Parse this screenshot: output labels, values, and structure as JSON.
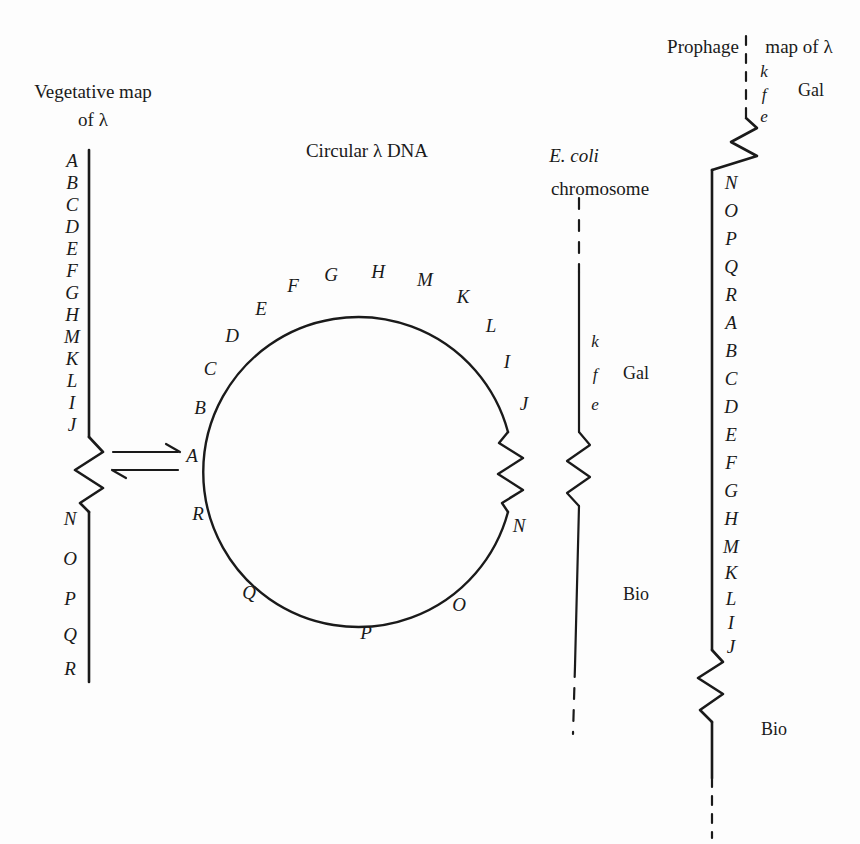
{
  "figure": {
    "background_color": "#fdfdfd",
    "ink_color": "#1a1a1a",
    "lambda": "λ"
  },
  "vegetative_map": {
    "title_line1": "Vegetative map",
    "title_line2": "of λ",
    "genes_upper": [
      "A",
      "B",
      "C",
      "D",
      "E",
      "F",
      "G",
      "H",
      "M",
      "K",
      "L",
      "I",
      "J"
    ],
    "genes_lower": [
      "N",
      "O",
      "P",
      "Q",
      "R"
    ],
    "has_zigzag": true
  },
  "equilibrium": {
    "symbol": "⇌",
    "description": "reversible-arrows"
  },
  "circular_map": {
    "title": "Circular λ DNA",
    "genes": [
      "A",
      "B",
      "C",
      "D",
      "E",
      "F",
      "G",
      "H",
      "M",
      "K",
      "L",
      "I",
      "J",
      "N",
      "O",
      "P",
      "Q",
      "R"
    ],
    "has_zigzag": true
  },
  "ecoli_chromosome": {
    "title_line1": "E. coli",
    "title_line2": "chromosome",
    "genes": [
      "k",
      "f",
      "e"
    ],
    "marker_gal": "Gal",
    "marker_bio": "Bio",
    "has_zigzag": true
  },
  "prophage_map": {
    "title_left": "Prophage",
    "title_right": "map of λ",
    "genes_top": [
      "k",
      "f",
      "e"
    ],
    "marker_gal": "Gal",
    "genes_main": [
      "N",
      "O",
      "P",
      "Q",
      "R",
      "A",
      "B",
      "C",
      "D",
      "E",
      "F",
      "G",
      "H",
      "M",
      "K",
      "L",
      "I",
      "J"
    ],
    "marker_bio": "Bio",
    "has_zigzag": true
  }
}
